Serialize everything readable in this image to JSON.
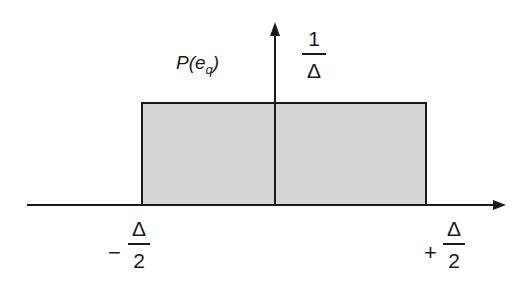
{
  "diagram": {
    "type": "uniform-probability-density",
    "y_label": {
      "func": "P",
      "arg": "e",
      "arg_subscript": "q"
    },
    "height_label": {
      "numerator": "1",
      "denominator": "Δ"
    },
    "left_bound": {
      "sign": "−",
      "numerator": "Δ",
      "denominator": "2"
    },
    "right_bound": {
      "sign": "+",
      "numerator": "Δ",
      "denominator": "2"
    },
    "colors": {
      "fill": "#d6d6d6",
      "stroke": "#1a1a1a"
    }
  }
}
